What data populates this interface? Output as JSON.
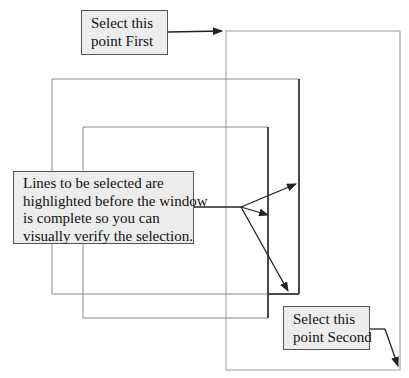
{
  "callouts": {
    "first": {
      "lines": [
        "Select this",
        "point First"
      ]
    },
    "highlight": {
      "lines": [
        "Lines to be selected are",
        "highlighted before the window",
        "is complete so you can",
        "visually verify the selection."
      ]
    },
    "second": {
      "lines": [
        "Select this",
        "point Second"
      ]
    }
  },
  "colors": {
    "callout_fill": "#ececec",
    "callout_border": "#555555",
    "line_normal": "#8a8a8a",
    "line_highlighted": "#4a4a4a",
    "arrow": "#222222"
  }
}
